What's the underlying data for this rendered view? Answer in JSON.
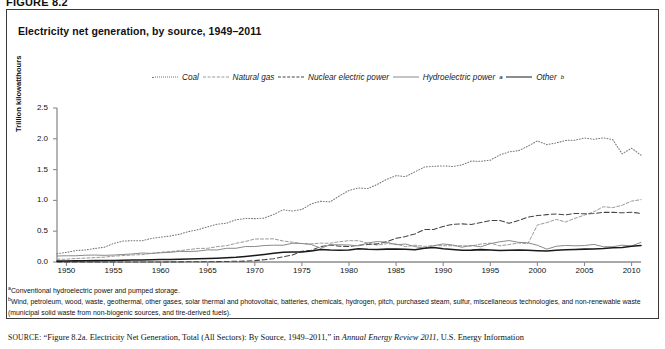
{
  "figure": {
    "label": "FIGURE 8.2",
    "title": "Electricity net generation, by source, 1949–2011"
  },
  "legend": {
    "position": "top-center",
    "items": [
      {
        "label": "Coal",
        "style": "dotted",
        "color": "#777777",
        "name": "legend-coal"
      },
      {
        "label": "Natural gas",
        "style": "dashed-short",
        "color": "#999999",
        "name": "legend-natural-gas"
      },
      {
        "label": "Nuclear electric power",
        "style": "dashed-long",
        "color": "#444444",
        "name": "legend-nuclear"
      },
      {
        "label": "Hydroelectric power",
        "sup": "a",
        "style": "solid-thin",
        "color": "#8a8a8a",
        "name": "legend-hydro"
      },
      {
        "label": "Other",
        "sup": "b",
        "style": "solid-thick",
        "color": "#1a1a1a",
        "name": "legend-other"
      }
    ]
  },
  "footnotes": [
    {
      "mark": "a",
      "text": "Conventional hydroelectric power and pumped storage."
    },
    {
      "mark": "b",
      "text": "Wind, petroleum, wood, waste, geothermal, other gases, solar thermal and photovoltaic, batteries, chemicals, hydrogen, pitch, purchased steam, sulfur, miscellaneous technologies, and non-renewable waste (municipal solid waste from non-biogenic sources, and tire-derived fuels)."
    }
  ],
  "source": {
    "prefix": "SOURCE:",
    "quoted": "“Figure 8.2a. Electricity Net Generation, Total (All Sectors): By Source, 1949–2011,”",
    "connector": " in ",
    "italic": "Annual Energy Review 2011",
    "tail": ", U.S. Energy Information"
  },
  "chart_data": {
    "type": "line",
    "title": "Electricity net generation, by source, 1949–2011",
    "xlabel": "",
    "ylabel": "Trillion kilowatthours",
    "xlim": [
      1949,
      2011
    ],
    "ylim": [
      0.0,
      2.5
    ],
    "yticks": [
      0.0,
      0.5,
      1.0,
      1.5,
      2.0,
      2.5
    ],
    "ytick_labels": [
      "0.0",
      "0.5",
      "1.0",
      "1.5",
      "2.0",
      "2.5"
    ],
    "xticks": [
      1950,
      1955,
      1960,
      1965,
      1970,
      1975,
      1980,
      1985,
      1990,
      1995,
      2000,
      2005,
      2010
    ],
    "xtick_labels": [
      "1950",
      "1955",
      "1960",
      "1965",
      "1970",
      "1975",
      "1980",
      "1985",
      "1990",
      "1995",
      "2000",
      "2005",
      "2010"
    ],
    "grid": false,
    "x": [
      1949,
      1950,
      1951,
      1952,
      1953,
      1954,
      1955,
      1956,
      1957,
      1958,
      1959,
      1960,
      1961,
      1962,
      1963,
      1964,
      1965,
      1966,
      1967,
      1968,
      1969,
      1970,
      1971,
      1972,
      1973,
      1974,
      1975,
      1976,
      1977,
      1978,
      1979,
      1980,
      1981,
      1982,
      1983,
      1984,
      1985,
      1986,
      1987,
      1988,
      1989,
      1990,
      1991,
      1992,
      1993,
      1994,
      1995,
      1996,
      1997,
      1998,
      1999,
      2000,
      2001,
      2002,
      2003,
      2004,
      2005,
      2006,
      2007,
      2008,
      2009,
      2010,
      2011
    ],
    "series": [
      {
        "name": "Coal",
        "style": "dotted",
        "color": "#777777",
        "values": [
          0.135,
          0.155,
          0.185,
          0.195,
          0.219,
          0.239,
          0.301,
          0.339,
          0.346,
          0.344,
          0.382,
          0.403,
          0.422,
          0.45,
          0.494,
          0.526,
          0.571,
          0.613,
          0.63,
          0.685,
          0.706,
          0.704,
          0.713,
          0.771,
          0.848,
          0.828,
          0.853,
          0.944,
          0.985,
          0.976,
          1.075,
          1.162,
          1.203,
          1.192,
          1.259,
          1.342,
          1.402,
          1.386,
          1.464,
          1.541,
          1.554,
          1.56,
          1.551,
          1.576,
          1.639,
          1.635,
          1.653,
          1.737,
          1.788,
          1.807,
          1.881,
          1.966,
          1.904,
          1.933,
          1.974,
          1.978,
          2.013,
          1.991,
          2.016,
          1.986,
          1.756,
          1.847,
          1.734
        ]
      },
      {
        "name": "Natural gas",
        "style": "dashed-short",
        "color": "#999999",
        "values": [
          0.045,
          0.045,
          0.057,
          0.063,
          0.073,
          0.078,
          0.095,
          0.104,
          0.114,
          0.12,
          0.139,
          0.158,
          0.169,
          0.184,
          0.202,
          0.22,
          0.222,
          0.25,
          0.264,
          0.303,
          0.333,
          0.373,
          0.374,
          0.376,
          0.341,
          0.32,
          0.3,
          0.295,
          0.306,
          0.305,
          0.329,
          0.346,
          0.346,
          0.305,
          0.274,
          0.297,
          0.292,
          0.249,
          0.273,
          0.253,
          0.267,
          0.264,
          0.264,
          0.264,
          0.259,
          0.291,
          0.307,
          0.263,
          0.283,
          0.309,
          0.297,
          0.601,
          0.639,
          0.691,
          0.65,
          0.71,
          0.761,
          0.816,
          0.897,
          0.883,
          0.921,
          0.988,
          1.013
        ]
      },
      {
        "name": "Nuclear electric power",
        "style": "dashed-long",
        "color": "#444444",
        "values": [
          0.0,
          0.0,
          0.0,
          0.0,
          0.0,
          0.0,
          0.0,
          0.0,
          0.0,
          0.0,
          0.0,
          0.001,
          0.002,
          0.002,
          0.003,
          0.003,
          0.004,
          0.006,
          0.008,
          0.013,
          0.014,
          0.022,
          0.038,
          0.054,
          0.083,
          0.114,
          0.173,
          0.191,
          0.251,
          0.276,
          0.255,
          0.251,
          0.273,
          0.283,
          0.294,
          0.328,
          0.384,
          0.414,
          0.455,
          0.527,
          0.529,
          0.577,
          0.613,
          0.619,
          0.61,
          0.64,
          0.673,
          0.675,
          0.628,
          0.674,
          0.728,
          0.754,
          0.769,
          0.78,
          0.764,
          0.789,
          0.782,
          0.787,
          0.806,
          0.806,
          0.799,
          0.807,
          0.79
        ]
      },
      {
        "name": "Hydroelectric power",
        "style": "solid-thin",
        "color": "#8a8a8a",
        "values": [
          0.097,
          0.101,
          0.101,
          0.11,
          0.113,
          0.108,
          0.113,
          0.122,
          0.131,
          0.146,
          0.139,
          0.149,
          0.157,
          0.172,
          0.17,
          0.177,
          0.197,
          0.195,
          0.222,
          0.223,
          0.251,
          0.251,
          0.267,
          0.273,
          0.272,
          0.304,
          0.3,
          0.284,
          0.223,
          0.28,
          0.28,
          0.276,
          0.261,
          0.31,
          0.332,
          0.321,
          0.281,
          0.291,
          0.25,
          0.223,
          0.266,
          0.293,
          0.276,
          0.24,
          0.269,
          0.247,
          0.297,
          0.328,
          0.348,
          0.319,
          0.311,
          0.272,
          0.209,
          0.255,
          0.269,
          0.263,
          0.267,
          0.286,
          0.248,
          0.248,
          0.273,
          0.26,
          0.319
        ]
      },
      {
        "name": "Other",
        "style": "solid-thick",
        "color": "#1a1a1a",
        "values": [
          0.014,
          0.016,
          0.018,
          0.02,
          0.022,
          0.024,
          0.026,
          0.029,
          0.032,
          0.034,
          0.037,
          0.039,
          0.042,
          0.045,
          0.049,
          0.053,
          0.057,
          0.062,
          0.068,
          0.077,
          0.09,
          0.105,
          0.123,
          0.141,
          0.159,
          0.164,
          0.161,
          0.179,
          0.203,
          0.195,
          0.191,
          0.196,
          0.216,
          0.206,
          0.203,
          0.209,
          0.212,
          0.207,
          0.2,
          0.223,
          0.234,
          0.214,
          0.204,
          0.192,
          0.193,
          0.201,
          0.195,
          0.187,
          0.19,
          0.196,
          0.19,
          0.184,
          0.18,
          0.19,
          0.198,
          0.204,
          0.209,
          0.212,
          0.218,
          0.231,
          0.237,
          0.255,
          0.268
        ]
      }
    ]
  }
}
